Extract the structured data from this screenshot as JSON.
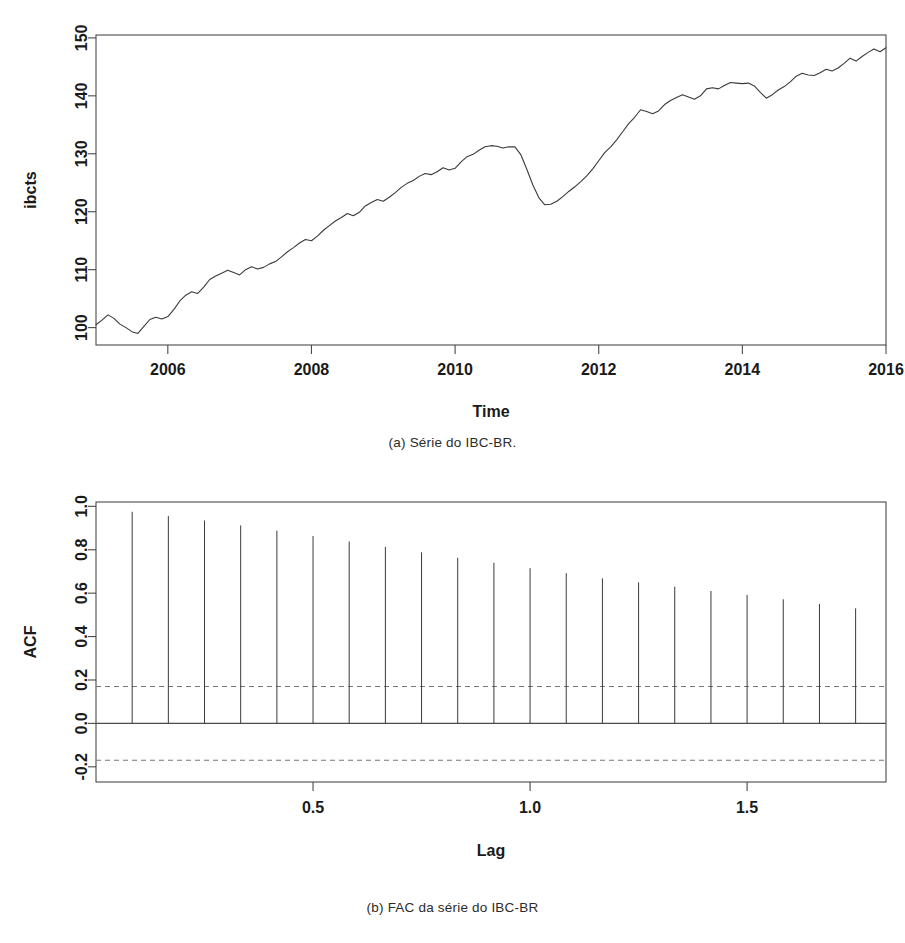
{
  "figure_a": {
    "caption": "(a) Série do IBC-BR.",
    "chart_data": {
      "type": "line",
      "title": "",
      "xlabel": "Time",
      "ylabel": "ibcts",
      "xlim": [
        2005.0,
        2016.0
      ],
      "ylim": [
        97.0,
        150.5
      ],
      "xticks": [
        2006,
        2008,
        2010,
        2012,
        2014,
        2016
      ],
      "xticklabels": [
        "2006",
        "2008",
        "2010",
        "2012",
        "2014",
        "2016"
      ],
      "yticks": [
        100,
        110,
        120,
        130,
        140,
        150
      ],
      "yticklabels": [
        "100",
        "110",
        "120",
        "130",
        "140",
        "150"
      ],
      "grid": false,
      "legend": "none",
      "series": [
        {
          "name": "ibcts",
          "x": [
            2005.0,
            2005.083,
            2005.167,
            2005.25,
            2005.333,
            2005.417,
            2005.5,
            2005.583,
            2005.667,
            2005.75,
            2005.833,
            2005.917,
            2006.0,
            2006.083,
            2006.167,
            2006.25,
            2006.333,
            2006.417,
            2006.5,
            2006.583,
            2006.667,
            2006.75,
            2006.833,
            2006.917,
            2007.0,
            2007.083,
            2007.167,
            2007.25,
            2007.333,
            2007.417,
            2007.5,
            2007.583,
            2007.667,
            2007.75,
            2007.833,
            2007.917,
            2008.0,
            2008.083,
            2008.167,
            2008.25,
            2008.333,
            2008.417,
            2008.5,
            2008.583,
            2008.667,
            2008.75,
            2008.833,
            2008.917,
            2009.0,
            2009.083,
            2009.167,
            2009.25,
            2009.333,
            2009.417,
            2009.5,
            2009.583,
            2009.667,
            2009.75,
            2009.833,
            2009.917,
            2010.0,
            2010.083,
            2010.167,
            2010.25,
            2010.333,
            2010.417,
            2010.5,
            2010.583,
            2010.667,
            2010.75,
            2010.833,
            2010.917,
            2011.0,
            2011.083,
            2011.167,
            2011.25,
            2011.333,
            2011.417,
            2011.5,
            2011.583,
            2011.667,
            2011.75,
            2011.833,
            2011.917,
            2012.0,
            2012.083,
            2012.167,
            2012.25,
            2012.333,
            2012.417,
            2012.5,
            2012.583,
            2012.667,
            2012.75,
            2012.833,
            2012.917,
            2013.0,
            2013.083,
            2013.167,
            2013.25,
            2013.333,
            2013.417,
            2013.5,
            2013.583,
            2013.667,
            2013.75,
            2013.833,
            2013.917,
            2014.0,
            2014.083,
            2014.167,
            2014.25,
            2014.333,
            2014.417,
            2014.5,
            2014.583,
            2014.667,
            2014.75,
            2014.833,
            2014.917,
            2015.0,
            2015.083,
            2015.167,
            2015.25,
            2015.333,
            2015.417,
            2015.5,
            2015.583,
            2015.667,
            2015.75,
            2015.833,
            2015.917,
            2016.0
          ],
          "y": [
            100.5,
            101.3,
            102.2,
            101.6,
            100.6,
            100.0,
            99.3,
            99.0,
            100.2,
            101.4,
            101.8,
            101.5,
            101.9,
            103.1,
            104.6,
            105.6,
            106.2,
            105.9,
            107.0,
            108.3,
            108.9,
            109.4,
            109.9,
            109.5,
            109.1,
            110.0,
            110.5,
            110.1,
            110.4,
            111.0,
            111.4,
            112.2,
            113.1,
            113.8,
            114.6,
            115.2,
            115.0,
            115.8,
            116.8,
            117.6,
            118.4,
            119.0,
            119.7,
            119.3,
            119.9,
            121.0,
            121.6,
            122.1,
            121.8,
            122.5,
            123.3,
            124.2,
            124.9,
            125.4,
            126.1,
            126.6,
            126.4,
            126.9,
            127.6,
            127.2,
            127.5,
            128.6,
            129.5,
            129.9,
            130.6,
            131.2,
            131.4,
            131.3,
            131.0,
            131.2,
            131.2,
            129.8,
            127.3,
            124.6,
            122.4,
            121.2,
            121.3,
            121.8,
            122.6,
            123.5,
            124.3,
            125.2,
            126.2,
            127.4,
            128.8,
            130.2,
            131.2,
            132.4,
            133.8,
            135.2,
            136.3,
            137.6,
            137.3,
            136.9,
            137.4,
            138.5,
            139.2,
            139.7,
            140.2,
            139.8,
            139.4,
            140.0,
            141.2,
            141.4,
            141.2,
            141.8,
            142.3,
            142.2,
            142.1,
            142.2,
            141.7,
            140.6,
            139.6,
            140.2,
            141.0,
            141.6,
            142.4,
            143.4,
            143.9,
            143.6,
            143.5,
            144.0,
            144.6,
            144.3,
            144.8,
            145.6,
            146.5,
            146.0,
            146.8,
            147.5,
            148.1,
            147.6,
            148.3,
            148.7,
            148.6
          ]
        }
      ]
    }
  },
  "figure_b": {
    "caption": "(b) FAC da série do IBC-BR",
    "chart_data": {
      "type": "bar",
      "title": "",
      "xlabel": "Lag",
      "ylabel": "ACF",
      "xlim": [
        0.0,
        1.82
      ],
      "ylim": [
        -0.27,
        1.02
      ],
      "xticks": [
        0.5,
        1.0,
        1.5
      ],
      "xticklabels": [
        "0.5",
        "1.0",
        "1.5"
      ],
      "yticks": [
        -0.2,
        0.0,
        0.2,
        0.4,
        0.6,
        0.8,
        1.0
      ],
      "yticklabels": [
        "-0.2",
        "0.0",
        "0.2",
        "0.4",
        "0.6",
        "0.8",
        "1.0"
      ],
      "grid": false,
      "legend": "none",
      "confidence_bands": [
        0.17,
        -0.17
      ],
      "categories": [
        0.0833,
        0.1667,
        0.25,
        0.3333,
        0.4167,
        0.5,
        0.5833,
        0.6667,
        0.75,
        0.8333,
        0.9167,
        1.0,
        1.0833,
        1.1667,
        1.25,
        1.3333,
        1.4167,
        1.5,
        1.5833,
        1.6667,
        1.75
      ],
      "values": [
        0.975,
        0.955,
        0.935,
        0.912,
        0.888,
        0.863,
        0.838,
        0.813,
        0.788,
        0.763,
        0.74,
        0.715,
        0.692,
        0.668,
        0.65,
        0.63,
        0.61,
        0.592,
        0.572,
        0.55,
        0.53
      ]
    }
  }
}
